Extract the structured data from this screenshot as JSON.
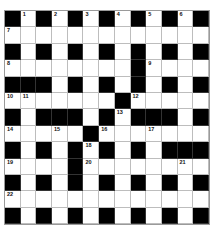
{
  "puzzle": {
    "rows": 13,
    "cols": 13,
    "colors": {
      "block": "#000000",
      "cell": "#ffffff",
      "gridline": "#bdbdbd"
    },
    "grid": [
      "#.#.#.#.#.#.#",
      ".............",
      "#.#.#.#.#.#.#",
      "........#....",
      "###.#.#.#.#.#",
      ".......#.....",
      "#.###.#.###.#",
      ".....#.......",
      "#.#.#.#.#.###",
      "....#........",
      "#.#.#.#.#.#.#",
      ".............",
      "#.#.#.#.#.#.#"
    ],
    "numbers": [
      {
        "r": 0,
        "c": 1,
        "n": "1"
      },
      {
        "r": 0,
        "c": 3,
        "n": "2"
      },
      {
        "r": 0,
        "c": 5,
        "n": "3"
      },
      {
        "r": 0,
        "c": 7,
        "n": "4"
      },
      {
        "r": 0,
        "c": 9,
        "n": "5"
      },
      {
        "r": 0,
        "c": 11,
        "n": "6"
      },
      {
        "r": 1,
        "c": 0,
        "n": "7"
      },
      {
        "r": 3,
        "c": 0,
        "n": "8"
      },
      {
        "r": 3,
        "c": 9,
        "n": "9"
      },
      {
        "r": 5,
        "c": 0,
        "n": "10"
      },
      {
        "r": 5,
        "c": 1,
        "n": "11"
      },
      {
        "r": 5,
        "c": 8,
        "n": "12"
      },
      {
        "r": 6,
        "c": 7,
        "n": "13"
      },
      {
        "r": 7,
        "c": 0,
        "n": "14"
      },
      {
        "r": 7,
        "c": 3,
        "n": "15"
      },
      {
        "r": 7,
        "c": 6,
        "n": "16"
      },
      {
        "r": 7,
        "c": 9,
        "n": "17"
      },
      {
        "r": 8,
        "c": 5,
        "n": "18"
      },
      {
        "r": 9,
        "c": 0,
        "n": "19"
      },
      {
        "r": 9,
        "c": 5,
        "n": "20"
      },
      {
        "r": 9,
        "c": 11,
        "n": "21"
      },
      {
        "r": 11,
        "c": 0,
        "n": "22"
      }
    ]
  }
}
